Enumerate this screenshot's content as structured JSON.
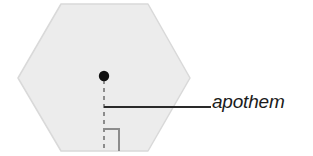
{
  "figure": {
    "kind": "geometry-diagram",
    "background_color": "#ffffff",
    "annotation": {
      "label": "apothem",
      "style": "italic",
      "color": "#1b1b1b"
    },
    "shape": {
      "name": "regular-hexagon",
      "orientation": "flat-top",
      "sides": 6,
      "fill_color": "#ececec",
      "stroke_color": "#d8d8d8",
      "vertices": [
        {
          "x": 61,
          "y": 4
        },
        {
          "x": 148,
          "y": 4
        },
        {
          "x": 190,
          "y": 78
        },
        {
          "x": 148,
          "y": 151
        },
        {
          "x": 61,
          "y": 151
        },
        {
          "x": 18,
          "y": 78
        }
      ]
    },
    "center_point": {
      "name": "center",
      "x": 104,
      "y": 76,
      "radius": 5,
      "color": "#111111"
    },
    "apothem_segment": {
      "from": {
        "x": 104,
        "y": 80
      },
      "to": {
        "x": 104,
        "y": 151
      },
      "style": "dashed",
      "dash": "4 4",
      "color": "#8c8c8c",
      "width": 2
    },
    "right_angle_marker": {
      "color": "#8c8c8c",
      "width": 2,
      "corner": {
        "x": 104,
        "y": 151
      },
      "path": "M 104 129 L 119 129 L 119 151"
    },
    "leader_line": {
      "from": {
        "x": 104,
        "y": 107
      },
      "to": {
        "x": 211,
        "y": 107
      },
      "color": "#2a2a2a",
      "width": 2
    }
  }
}
